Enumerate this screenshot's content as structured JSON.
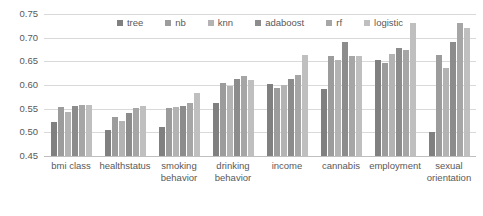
{
  "chart_data": {
    "type": "bar",
    "title": "",
    "xlabel": "",
    "ylabel": "",
    "ylim": [
      0.45,
      0.75
    ],
    "ytick_labels": [
      "0.75",
      "0.70",
      "0.65",
      "0.60",
      "0.55",
      "0.50",
      "0.45"
    ],
    "ytick_values": [
      0.75,
      0.7,
      0.65,
      0.6,
      0.55,
      0.5,
      0.45
    ],
    "grid": true,
    "legend_position": "top-center",
    "categories": [
      "bmi class",
      "healthstatus",
      "smoking behavior",
      "drinking behavior",
      "income",
      "cannabis",
      "employment",
      "sexual orientation"
    ],
    "series": [
      {
        "name": "tree",
        "color": "#808080",
        "values": [
          0.521,
          0.505,
          0.512,
          0.562,
          0.603,
          0.591,
          0.652,
          0.501
        ]
      },
      {
        "name": "nb",
        "color": "#9c9c9c",
        "values": [
          0.554,
          0.532,
          0.552,
          0.604,
          0.594,
          0.662,
          0.646,
          0.663
        ]
      },
      {
        "name": "knn",
        "color": "#b3b3b3",
        "values": [
          0.543,
          0.525,
          0.554,
          0.598,
          0.6,
          0.652,
          0.666,
          0.636
        ]
      },
      {
        "name": "adaboost",
        "color": "#8c8c8c",
        "values": [
          0.556,
          0.541,
          0.555,
          0.612,
          0.613,
          0.69,
          0.679,
          0.69
        ]
      },
      {
        "name": "rf",
        "color": "#a6a6a6",
        "values": [
          0.557,
          0.552,
          0.561,
          0.62,
          0.621,
          0.662,
          0.673,
          0.731
        ]
      },
      {
        "name": "logistic",
        "color": "#bfbfbf",
        "values": [
          0.557,
          0.555,
          0.583,
          0.611,
          0.664,
          0.661,
          0.731,
          0.721
        ]
      }
    ]
  },
  "legend": {
    "items": [
      {
        "label": "tree"
      },
      {
        "label": "nb"
      },
      {
        "label": "knn"
      },
      {
        "label": "adaboost"
      },
      {
        "label": "rf"
      },
      {
        "label": "logistic"
      }
    ]
  }
}
